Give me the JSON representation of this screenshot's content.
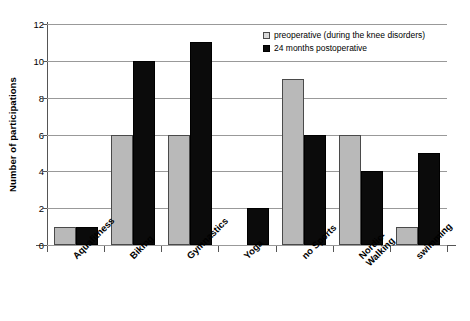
{
  "chart_data": {
    "type": "bar",
    "title": "",
    "xlabel": "",
    "ylabel": "Number of participations",
    "ylim": [
      0,
      12
    ],
    "yticks": [
      0,
      2,
      4,
      6,
      8,
      10,
      12
    ],
    "grid": true,
    "legend_position": "top-right",
    "categories": [
      "Aquafitness",
      "Biking",
      "Gymnastics",
      "Yoga",
      "no Sports",
      "Nordic-\nWalking",
      "swimming"
    ],
    "series": [
      {
        "name": "preoperative (during the knee disorders)",
        "color": "#b9b9b9",
        "values": [
          1,
          6,
          6,
          0,
          9,
          6,
          1
        ]
      },
      {
        "name": "24 months postoperative",
        "color": "#0b0b0b",
        "values": [
          1,
          10,
          11,
          2,
          6,
          4,
          5
        ]
      }
    ]
  },
  "legend": {
    "items": [
      {
        "label": "preoperative (during the knee disorders)",
        "swatch": "pre"
      },
      {
        "label": "24 months postoperative",
        "swatch": "post"
      }
    ]
  }
}
